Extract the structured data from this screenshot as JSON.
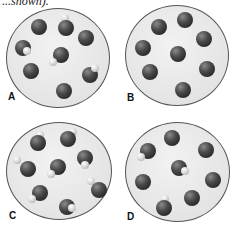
{
  "header_fragment": "...shown).",
  "panels": [
    {
      "label": "A",
      "description": "8 particles: 4 single atoms, 4 diatomic molecules (dark + light atom)"
    },
    {
      "label": "B",
      "description": "8 particles: all single dark atoms"
    },
    {
      "label": "C",
      "description": "8 particles: all diatomic molecules (dark + light atom)"
    },
    {
      "label": "D",
      "description": "8 particles: 5 single atoms, 3 diatomic molecules"
    }
  ],
  "colors": {
    "large_atom": "#2e2e2e",
    "small_atom": "#d8d8d8",
    "circle_fill": "#e6e6e6",
    "circle_border": "#555555"
  }
}
